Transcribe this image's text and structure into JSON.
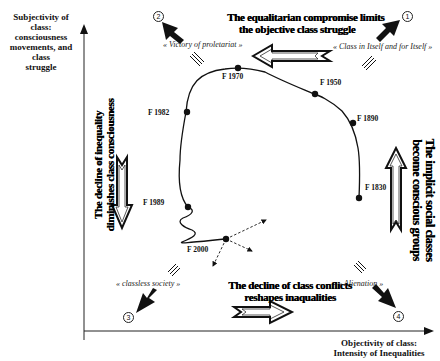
{
  "axes": {
    "y_title_lines": [
      "Subjectivity of class:",
      "consciousness",
      "movements,  and class",
      "struggle"
    ],
    "x_title_lines": [
      "Objectivity of class:",
      "Intensity of Inequalities"
    ]
  },
  "corners": {
    "c1": {
      "number": "1",
      "quote": "« Class in Itself and for Itself »"
    },
    "c2": {
      "number": "2",
      "quote": "« Victory of proletariat »"
    },
    "c3": {
      "number": "3",
      "quote": "« classless society »"
    },
    "c4": {
      "number": "4",
      "quote": "« Alienation »"
    }
  },
  "captions": {
    "top": [
      "The equalitarian compromise limits",
      "the objective class struggle"
    ],
    "bottom": [
      "The decline of class conflicts",
      "reshapes inaqualities"
    ],
    "left": [
      "The decline of inequality",
      "diminishes class consciousness"
    ],
    "right": [
      "The implicit social classes",
      "become conscious groups"
    ]
  },
  "trajectory_points": [
    {
      "label": "F 1830"
    },
    {
      "label": "F 1890"
    },
    {
      "label": "F 1950"
    },
    {
      "label": "F 1970"
    },
    {
      "label": "F 1982"
    },
    {
      "label": "F 1989"
    },
    {
      "label": "F 2000"
    }
  ],
  "colors": {
    "ink": "#111111",
    "background": "#ffffff",
    "arrow_fill": "#ffffff"
  }
}
